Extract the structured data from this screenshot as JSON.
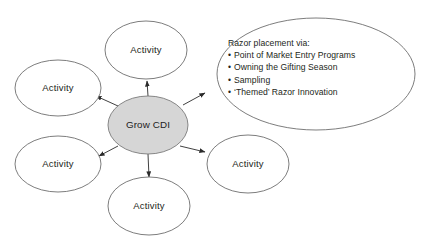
{
  "diagram": {
    "title_text": "Grow CDI",
    "center": {
      "label": "Grow CDI",
      "fill_color": "#d6d6d6",
      "stroke_color": "#7a7a7a",
      "cx": 148,
      "cy": 125,
      "rx": 40,
      "ry": 29
    },
    "satellites": [
      {
        "label": "Activity",
        "cx": 146,
        "cy": 50,
        "rx": 41,
        "ry": 29,
        "name": "activity-top"
      },
      {
        "label": "Activity",
        "cx": 58,
        "cy": 88,
        "rx": 43,
        "ry": 28,
        "name": "activity-upper-left"
      },
      {
        "label": "Activity",
        "cx": 58,
        "cy": 164,
        "rx": 43,
        "ry": 28,
        "name": "activity-lower-left"
      },
      {
        "label": "Activity",
        "cx": 149,
        "cy": 206,
        "rx": 41,
        "ry": 29,
        "name": "activity-bottom"
      },
      {
        "label": "Activity",
        "cx": 248,
        "cy": 164,
        "rx": 41,
        "ry": 29,
        "name": "activity-lower-right"
      }
    ],
    "callout": {
      "heading": "Razor placement via:",
      "bullet_glyph": "•",
      "bullets": [
        "Point of Market Entry Programs",
        "Owning the Gifting Season",
        "Sampling",
        "‘Themed’ Razor Innovation"
      ],
      "cx": 316,
      "cy": 74,
      "rx": 99,
      "ry": 56
    },
    "stroke_color": "#6e6e6e",
    "arrow_color": "#2b2b2b",
    "background_color": "#ffffff",
    "connectors": [
      {
        "name": "connector-to-activity-top",
        "x1": 148,
        "y1": 96,
        "x2": 147,
        "y2": 81
      },
      {
        "name": "connector-to-activity-upper-left",
        "x1": 118,
        "y1": 106,
        "x2": 96,
        "y2": 96
      },
      {
        "name": "connector-to-activity-lower-left",
        "x1": 118,
        "y1": 146,
        "x2": 99,
        "y2": 156
      },
      {
        "name": "connector-to-activity-bottom",
        "x1": 148,
        "y1": 154,
        "x2": 149,
        "y2": 177
      },
      {
        "name": "connector-to-activity-lower-right",
        "x1": 180,
        "y1": 146,
        "x2": 205,
        "y2": 152
      },
      {
        "name": "connector-to-callout",
        "x1": 183,
        "y1": 105,
        "x2": 205,
        "y2": 93
      }
    ]
  }
}
